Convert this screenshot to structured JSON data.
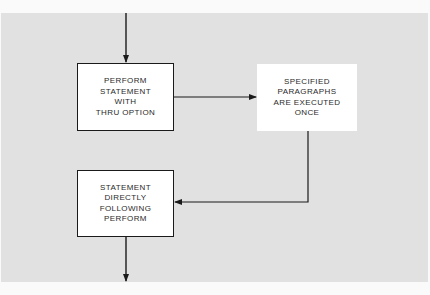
{
  "diagram": {
    "type": "flowchart",
    "colors": {
      "background": "#e1e1e1",
      "box_fill": "#ffffff",
      "line": "#1a1a1a"
    },
    "nodes": [
      {
        "id": "perform",
        "label": "PERFORM\nSTATEMENT\nWITH\nTHRU OPTION",
        "style": "solid"
      },
      {
        "id": "paragraphs",
        "label": "SPECIFIED\nPARAGRAPHS\nARE EXECUTED\nONCE",
        "style": "dashed"
      },
      {
        "id": "following",
        "label": "STATEMENT\nDIRECTLY\nFOLLOWING\nPERFORM",
        "style": "solid"
      }
    ],
    "edges": [
      {
        "from": "(entry)",
        "to": "perform"
      },
      {
        "from": "perform",
        "to": "paragraphs"
      },
      {
        "from": "paragraphs",
        "to": "following"
      },
      {
        "from": "following",
        "to": "(exit)"
      }
    ]
  }
}
